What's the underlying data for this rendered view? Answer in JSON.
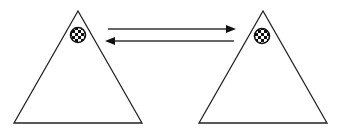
{
  "diagram": {
    "nodes": [
      {
        "id": "left-triangle",
        "shape": "triangle",
        "apex": [
          78,
          11
        ],
        "base_left": [
          14,
          123
        ],
        "base_right": [
          142,
          123
        ],
        "marker": {
          "type": "checkered-circle",
          "cx": 78,
          "cy": 35,
          "r": 8
        }
      },
      {
        "id": "right-triangle",
        "shape": "triangle",
        "apex": [
          263,
          11
        ],
        "base_left": [
          199,
          123
        ],
        "base_right": [
          327,
          123
        ],
        "marker": {
          "type": "checkered-circle",
          "cx": 262,
          "cy": 36,
          "r": 8
        }
      }
    ],
    "edges": [
      {
        "from": "left-triangle",
        "to": "right-triangle",
        "direction": "right",
        "y": 29
      },
      {
        "from": "right-triangle",
        "to": "left-triangle",
        "direction": "left",
        "y": 41
      }
    ],
    "colors": {
      "stroke": "#222222",
      "background": "#ffffff"
    }
  }
}
